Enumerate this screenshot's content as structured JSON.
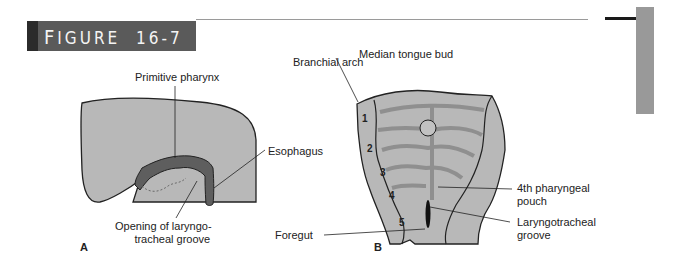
{
  "header": {
    "figure_label_first": "F",
    "figure_label_rest": "IGURE",
    "figure_number": "16-7"
  },
  "panel_a": {
    "letter": "A",
    "labels": {
      "primitive_pharynx": "Primitive pharynx",
      "esophagus": "Esophagus",
      "opening_line1": "Opening of laryngo-",
      "opening_line2": "tracheal groove"
    }
  },
  "panel_b": {
    "letter": "B",
    "labels": {
      "median_tongue_bud": "Median tongue bud",
      "branchial_arch": "Branchial arch",
      "fourth_pouch_line1": "4th pharyngeal",
      "fourth_pouch_line2": "pouch",
      "laryngotracheal_line1": "Laryngotracheal",
      "laryngotracheal_line2": "groove",
      "foregut": "Foregut"
    },
    "arch_numbers": [
      "1",
      "2",
      "3",
      "4",
      "5"
    ]
  },
  "colors": {
    "tissue_fill": "#b8b8b8",
    "dark_tissue": "#5e5e5e",
    "banner": "#5a5a5a",
    "side_tab": "#999999"
  }
}
